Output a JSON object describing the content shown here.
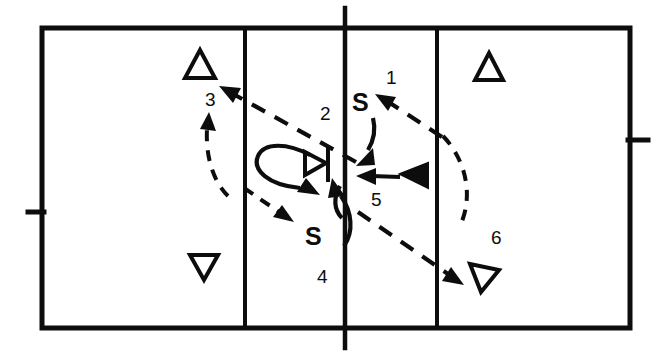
{
  "diagram": {
    "type": "volleyball-court-movement-diagram",
    "title": "",
    "colors": {
      "ink": "#0d0d0d",
      "background": "#ffffff"
    },
    "court": {
      "outline": {
        "x": 42,
        "y": 28,
        "width": 588,
        "height": 300
      },
      "lines": [
        {
          "name": "left-attack-line",
          "x": 245
        },
        {
          "name": "center-line",
          "x": 345
        },
        {
          "name": "right-attack-line",
          "x": 437
        }
      ],
      "ticks": [
        {
          "name": "left-sideline-tick",
          "side": "left",
          "y": 212
        },
        {
          "name": "right-sideline-tick",
          "side": "right",
          "y": 140
        },
        {
          "name": "center-line-tick-top",
          "side": "top"
        },
        {
          "name": "center-line-tick-bottom",
          "side": "bottom"
        }
      ]
    },
    "step_labels": [
      {
        "id": "step-1",
        "text": "1",
        "x": 386,
        "y": 68
      },
      {
        "id": "step-2",
        "text": "2",
        "x": 320,
        "y": 104
      },
      {
        "id": "step-3",
        "text": "3",
        "x": 205,
        "y": 90
      },
      {
        "id": "step-4",
        "text": "4",
        "x": 317,
        "y": 267
      },
      {
        "id": "step-5",
        "text": "5",
        "x": 371,
        "y": 190
      },
      {
        "id": "step-6",
        "text": "6",
        "x": 491,
        "y": 228
      }
    ],
    "setter_labels": [
      {
        "id": "setter-front",
        "text": "S",
        "x": 352,
        "y": 90
      },
      {
        "id": "setter-back",
        "text": "S",
        "x": 305,
        "y": 224
      }
    ],
    "players": [
      {
        "id": "player-up-left",
        "marker": "triangle-up-outline",
        "x": 200,
        "y": 67
      },
      {
        "id": "player-up-right",
        "marker": "triangle-up-outline",
        "x": 489,
        "y": 68
      },
      {
        "id": "player-down-left",
        "marker": "triangle-down-outline",
        "x": 204,
        "y": 266
      },
      {
        "id": "player-down-right",
        "marker": "triangle-down-outline",
        "x": 485,
        "y": 277
      },
      {
        "id": "target-marker",
        "marker": "triangle-right-outline-with-bar",
        "x": 314,
        "y": 163
      },
      {
        "id": "ball-carrier",
        "marker": "triangle-left-filled",
        "x": 418,
        "y": 175
      }
    ],
    "movement_paths": [
      {
        "id": "path-1",
        "style": "dashed",
        "from": "right-court",
        "to": "setter-front",
        "arrow": "up-left"
      },
      {
        "id": "path-2",
        "style": "dashed",
        "from": "front-right",
        "to": "player-up-left",
        "arrow": "up-left"
      },
      {
        "id": "path-3",
        "style": "dashed",
        "from": "lower-left",
        "to": "player-up-left",
        "arrow": "up"
      },
      {
        "id": "path-4",
        "style": "solid-loop",
        "from": "target-marker",
        "to": "setter-back",
        "arrow": "down-right"
      },
      {
        "id": "path-5",
        "style": "dashed",
        "from": "setter-back",
        "to": "player-down-right",
        "arrow": "down-right"
      },
      {
        "id": "path-6",
        "style": "dashed-arc",
        "from": "right-court",
        "to": "center",
        "arrow": "none"
      },
      {
        "id": "path-7",
        "style": "solid",
        "from": "setter-front",
        "to": "center-left",
        "arrow": "down-left"
      },
      {
        "id": "path-8",
        "style": "solid",
        "from": "ball-carrier",
        "to": "setter-front",
        "arrow": "left"
      },
      {
        "id": "path-9",
        "style": "dashed",
        "from": "left-attack",
        "to": "center-low",
        "arrow": "down-right"
      }
    ]
  }
}
